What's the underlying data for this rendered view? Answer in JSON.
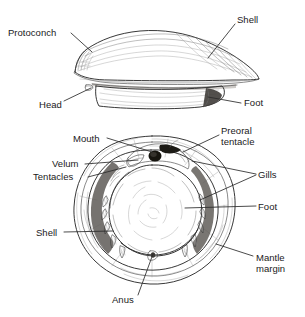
{
  "figure": {
    "background_color": "#ffffff",
    "ink_color": "#2d2d2d",
    "label_color": "#1a1a1a",
    "views": [
      {
        "id": "lateral",
        "name": "Lateral view of shell and body",
        "orientation": "side"
      },
      {
        "id": "ventral",
        "name": "Ventral view of body",
        "orientation": "underside"
      }
    ]
  },
  "labels": {
    "lateral": {
      "protoconch": "Protoconch",
      "shell": "Shell",
      "head": "Head",
      "foot": "Foot"
    },
    "ventral": {
      "mouth": "Mouth",
      "preoral_tentacle_line1": "Preoral",
      "preoral_tentacle_line2": "tentacle",
      "velum": "Velum",
      "tentacles": "Tentacles",
      "gills": "Gills",
      "foot": "Foot",
      "shell": "Shell",
      "mantle_margin_line1": "Mantle",
      "mantle_margin_line2": "margin",
      "anus": "Anus"
    }
  }
}
